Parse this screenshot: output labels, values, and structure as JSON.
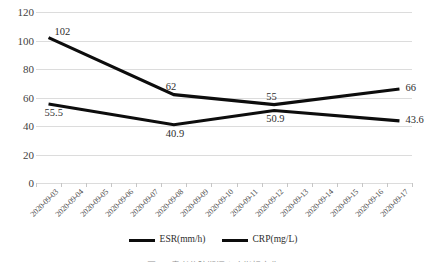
{
  "chart_data": {
    "type": "line",
    "title": "",
    "xlabel": "",
    "ylabel": "",
    "ylim": [
      0,
      120
    ],
    "ytick_step": 20,
    "grid": true,
    "legend_position": "bottom-center",
    "categories": [
      "2020-09-03",
      "2020-09-04",
      "2020-09-05",
      "2020-09-06",
      "2020-09-07",
      "2020-09-08",
      "2020-09-09",
      "2020-09-10",
      "2020-09-11",
      "2020-09-12",
      "2020-09-13",
      "2020-09-14",
      "2020-09-15",
      "2020-09-16",
      "2020-09-17"
    ],
    "ytick_labels": [
      "0",
      "20",
      "40",
      "60",
      "80",
      "100",
      "120"
    ],
    "series": [
      {
        "name": "ESR(mm/h)",
        "color": "#0d0d0d",
        "points": [
          {
            "category": "2020-09-03",
            "value": 102,
            "label": "102"
          },
          {
            "category": "2020-09-08",
            "value": 62,
            "label": "62"
          },
          {
            "category": "2020-09-12",
            "value": 55,
            "label": "55"
          },
          {
            "category": "2020-09-17",
            "value": 66,
            "label": "66"
          }
        ]
      },
      {
        "name": "CRP(mg/L)",
        "color": "#0d0d0d",
        "points": [
          {
            "category": "2020-09-03",
            "value": 55.5,
            "label": "55.5"
          },
          {
            "category": "2020-09-08",
            "value": 40.9,
            "label": "40.9"
          },
          {
            "category": "2020-09-12",
            "value": 50.9,
            "label": "50.9"
          },
          {
            "category": "2020-09-17",
            "value": 43.6,
            "label": "43.6"
          }
        ]
      }
    ]
  },
  "legend": {
    "items": [
      {
        "label": "ESR(mm/h)"
      },
      {
        "label": "CRP(mg/L)"
      }
    ]
  },
  "caption": {
    "text": "图2-2 患者住院期间炎症指标变化"
  }
}
